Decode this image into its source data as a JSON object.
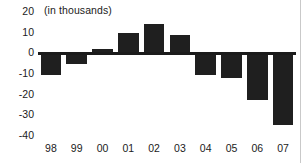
{
  "chart_data": {
    "type": "bar",
    "title": "",
    "subtitle": "(in thousands)",
    "xlabel": "",
    "ylabel": "",
    "categories": [
      "98",
      "99",
      "00",
      "01",
      "02",
      "03",
      "04",
      "05",
      "06",
      "07"
    ],
    "values": [
      -10.5,
      -5,
      2,
      10,
      14,
      9,
      -10.5,
      -12,
      -22.5,
      -34.5
    ],
    "ylim": [
      -40,
      20
    ],
    "yticks": [
      20,
      10,
      0,
      -10,
      -20,
      -30,
      -40
    ],
    "ytick_labels": [
      "20",
      "10",
      "0",
      "-10",
      "-20",
      "-30",
      "-40"
    ],
    "grid": false,
    "legend": null,
    "series": [
      {
        "name": "",
        "values": [
          -10.5,
          -5,
          2,
          10,
          14,
          9,
          -10.5,
          -12,
          -22.5,
          -34.5
        ]
      }
    ],
    "bar_color": "#1f1f1f",
    "axis_color": "#1b1b1b",
    "zero_line": true
  },
  "annotations": {
    "unit_note": "(in thousands)"
  }
}
